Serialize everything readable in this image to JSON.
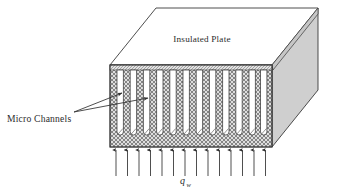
{
  "figure": {
    "type": "3d-block-diagram"
  },
  "labels": {
    "insulated_plate": "Insulated Plate",
    "micro_channels": "Micro Channels",
    "heat_flux_symbol": "q",
    "heat_flux_subscript": "w"
  },
  "geometry": {
    "channel_count": 12,
    "heat_flux_arrow_count": 14,
    "front_face": {
      "x": 110,
      "y": 65,
      "width": 162,
      "height": 82
    },
    "depth_dx": 46,
    "depth_dy": -57
  },
  "colors": {
    "outline": "#3a3a3a",
    "hatch_fill": "#d8d8d8",
    "hatch_line": "#6e6e6e",
    "side_face": "#cfcfcf",
    "top_face": "#ffffff",
    "channel_fill": "#ffffff",
    "text": "#2b2b2b",
    "arrow": "#2f2f2f"
  },
  "channels": [
    {
      "index": 1,
      "x": 117.0
    },
    {
      "index": 2,
      "x": 130.2
    },
    {
      "index": 3,
      "x": 143.4
    },
    {
      "index": 4,
      "x": 156.6
    },
    {
      "index": 5,
      "x": 169.8
    },
    {
      "index": 6,
      "x": 183.0
    },
    {
      "index": 7,
      "x": 196.2
    },
    {
      "index": 8,
      "x": 209.4
    },
    {
      "index": 9,
      "x": 222.6
    },
    {
      "index": 10,
      "x": 235.8
    },
    {
      "index": 11,
      "x": 249.0
    },
    {
      "index": 12,
      "x": 260.5
    }
  ],
  "heat_flux_arrows": [
    {
      "index": 1,
      "x": 116.0
    },
    {
      "index": 2,
      "x": 127.5
    },
    {
      "index": 3,
      "x": 139.0
    },
    {
      "index": 4,
      "x": 150.5
    },
    {
      "index": 5,
      "x": 162.0
    },
    {
      "index": 6,
      "x": 173.5
    },
    {
      "index": 7,
      "x": 185.0
    },
    {
      "index": 8,
      "x": 196.5
    },
    {
      "index": 9,
      "x": 208.0
    },
    {
      "index": 10,
      "x": 219.5
    },
    {
      "index": 11,
      "x": 231.0
    },
    {
      "index": 12,
      "x": 242.5
    },
    {
      "index": 13,
      "x": 254.0
    },
    {
      "index": 14,
      "x": 265.5
    }
  ],
  "leader_lines": [
    {
      "index": 1,
      "from_x": 74,
      "from_y": 112,
      "to_x": 122,
      "to_y": 93
    },
    {
      "index": 2,
      "from_x": 74,
      "from_y": 112,
      "to_x": 148,
      "to_y": 98
    }
  ]
}
